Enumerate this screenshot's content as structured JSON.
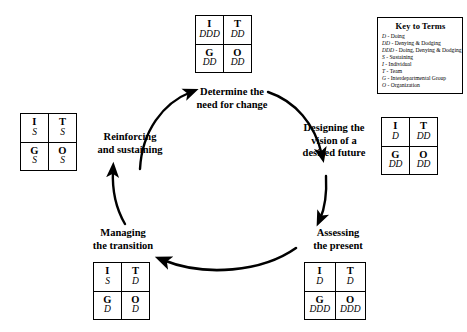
{
  "diagram": {
    "stages": [
      {
        "id": "determine",
        "label_lines": [
          "Determine the",
          "need for change"
        ]
      },
      {
        "id": "designing",
        "label_lines": [
          "Designing the",
          "vision of a",
          "desired future"
        ]
      },
      {
        "id": "assessing",
        "label_lines": [
          "Assessing",
          "the present"
        ]
      },
      {
        "id": "managing",
        "label_lines": [
          "Managing",
          "the transition"
        ]
      },
      {
        "id": "reinforcing",
        "label_lines": [
          "Reinforcing",
          "and sustaining"
        ]
      }
    ],
    "matrices": [
      {
        "id": "top",
        "stage": "determine",
        "cells": [
          {
            "head": "I",
            "value": "DDD"
          },
          {
            "head": "T",
            "value": "DD"
          },
          {
            "head": "G",
            "value": "DD"
          },
          {
            "head": "O",
            "value": "DD"
          }
        ]
      },
      {
        "id": "right",
        "stage": "designing",
        "cells": [
          {
            "head": "I",
            "value": "D"
          },
          {
            "head": "T",
            "value": "DD"
          },
          {
            "head": "G",
            "value": "DD"
          },
          {
            "head": "O",
            "value": "DD"
          }
        ]
      },
      {
        "id": "bottom-right",
        "stage": "assessing",
        "cells": [
          {
            "head": "I",
            "value": "D"
          },
          {
            "head": "T",
            "value": "D"
          },
          {
            "head": "G",
            "value": "DDD"
          },
          {
            "head": "O",
            "value": "DDD"
          }
        ]
      },
      {
        "id": "bottom-left",
        "stage": "managing",
        "cells": [
          {
            "head": "I",
            "value": "S"
          },
          {
            "head": "T",
            "value": "D"
          },
          {
            "head": "G",
            "value": "D"
          },
          {
            "head": "O",
            "value": "D"
          }
        ]
      },
      {
        "id": "left",
        "stage": "reinforcing",
        "cells": [
          {
            "head": "I",
            "value": "S"
          },
          {
            "head": "T",
            "value": "S"
          },
          {
            "head": "G",
            "value": "S"
          },
          {
            "head": "O",
            "value": "S"
          }
        ]
      }
    ]
  },
  "legend": {
    "title": "Key to Terms",
    "items": [
      {
        "symbol": "D",
        "separator": " - ",
        "text": "Doing"
      },
      {
        "symbol": "DD",
        "separator": " - ",
        "text": "Denying & Dodging"
      },
      {
        "symbol": "DDD",
        "separator": " - ",
        "text": "Doing, Denying & Dodging"
      },
      {
        "symbol": "S",
        "separator": " - ",
        "text": "Sustaining"
      },
      {
        "symbol": "I",
        "separator": " - ",
        "text": "Individual"
      },
      {
        "symbol": "T",
        "separator": " - ",
        "text": "Team"
      },
      {
        "symbol": "G",
        "separator": " - ",
        "text": "Interdepartmental Group"
      },
      {
        "symbol": "O",
        "separator": " - ",
        "text": "Organization"
      }
    ]
  },
  "colors": {
    "ink": "#000000",
    "background": "#ffffff"
  }
}
